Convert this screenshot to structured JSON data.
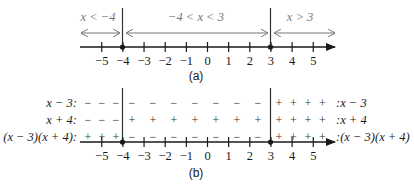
{
  "part_a": {
    "caption": "(a)",
    "interval_labels": [
      "x < −4",
      "−4 < x < 3",
      "x > 3"
    ],
    "ticks": [
      -5,
      -4,
      -3,
      -2,
      -1,
      0,
      1,
      2,
      3,
      4,
      5
    ],
    "tick_labels": [
      "−5",
      "−4",
      "−3",
      "−2",
      "−1",
      "0",
      "1",
      "2",
      "3",
      "4",
      "5"
    ],
    "critical_points": [
      -4,
      3
    ]
  },
  "part_b": {
    "caption": "(b)",
    "rows": [
      {
        "left_label": "x − 3:",
        "right_label": ":x − 3",
        "signs": [
          "−",
          "−",
          "−",
          "−",
          "−",
          "−",
          "−",
          "−",
          "−",
          "−",
          "+",
          "+",
          "+",
          "+"
        ]
      },
      {
        "left_label": "x + 4:",
        "right_label": ":x + 4",
        "signs": [
          "−",
          "−",
          "−",
          "+",
          "+",
          "+",
          "+",
          "+",
          "+",
          "+",
          "+",
          "+",
          "+",
          "+"
        ]
      },
      {
        "left_label": "(x − 3)(x + 4):",
        "right_label": ":(x − 3)(x + 4)",
        "signs": [
          "+",
          "+",
          "+",
          "−",
          "−",
          "−",
          "−",
          "−",
          "−",
          "−",
          "+",
          "+",
          "+",
          "+"
        ]
      }
    ],
    "ticks": [
      -5,
      -4,
      -3,
      -2,
      -1,
      0,
      1,
      2,
      3,
      4,
      5
    ],
    "tick_labels": [
      "−5",
      "−4",
      "−3",
      "−2",
      "−1",
      "0",
      "1",
      "2",
      "3",
      "4",
      "5"
    ],
    "critical_points": [
      -4,
      3
    ]
  },
  "colors": {
    "ink": "#1a1a1a",
    "gray": "#777777"
  }
}
